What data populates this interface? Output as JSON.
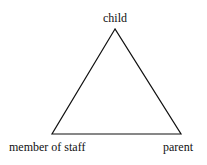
{
  "diagram": {
    "type": "triangle",
    "stroke_color": "#111111",
    "background": "#ffffff",
    "vertices": {
      "top": {
        "label": "child",
        "x": 115,
        "y": 29
      },
      "bottom_left": {
        "label": "member of staff",
        "x": 52,
        "y": 134
      },
      "bottom_right": {
        "label": "parent",
        "x": 181,
        "y": 134
      }
    }
  },
  "labels": {
    "top": "child",
    "bottom_left": "member of staff",
    "bottom_right": "parent"
  }
}
